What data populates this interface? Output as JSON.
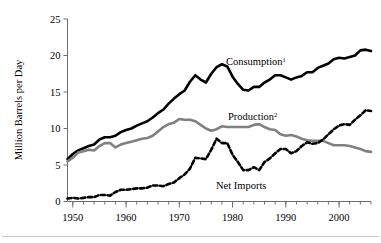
{
  "chart_data": {
    "type": "line",
    "title": "",
    "xlabel": "",
    "ylabel": "Million Barrels per Day",
    "xlim": [
      1949,
      2006
    ],
    "ylim": [
      0,
      25
    ],
    "grid": false,
    "legend_position": "inline-annotations",
    "y_ticks": [
      0,
      5,
      10,
      15,
      20,
      25
    ],
    "y_ticklabels": [
      "0",
      "5",
      "10",
      "15",
      "20",
      "25"
    ],
    "x_ticks": [
      1950,
      1960,
      1970,
      1980,
      1990,
      2000
    ],
    "x_ticklabels": [
      "1950",
      "1960",
      "1970",
      "1980",
      "1990",
      "2000"
    ],
    "x_minor_tick_interval": 2,
    "x": [
      1949,
      1950,
      1951,
      1952,
      1953,
      1954,
      1955,
      1956,
      1957,
      1958,
      1959,
      1960,
      1961,
      1962,
      1963,
      1964,
      1965,
      1966,
      1967,
      1968,
      1969,
      1970,
      1971,
      1972,
      1973,
      1974,
      1975,
      1976,
      1977,
      1978,
      1979,
      1980,
      1981,
      1982,
      1983,
      1984,
      1985,
      1986,
      1987,
      1988,
      1989,
      1990,
      1991,
      1992,
      1993,
      1994,
      1995,
      1996,
      1997,
      1998,
      1999,
      2000,
      2001,
      2002,
      2003,
      2004,
      2005,
      2006
    ],
    "series": [
      {
        "name": "Consumption",
        "label": "Consumption",
        "superscript": "1",
        "color": "#000000",
        "style": "solid",
        "width": 2.6,
        "values": [
          5.8,
          6.5,
          7.0,
          7.3,
          7.6,
          7.8,
          8.5,
          8.8,
          8.8,
          9.0,
          9.5,
          9.8,
          10.0,
          10.4,
          10.7,
          11.0,
          11.5,
          12.1,
          12.6,
          13.4,
          14.1,
          14.7,
          15.2,
          16.4,
          17.3,
          16.7,
          16.3,
          17.5,
          18.4,
          18.8,
          18.5,
          17.1,
          16.1,
          15.3,
          15.2,
          15.7,
          15.7,
          16.3,
          16.7,
          17.3,
          17.3,
          17.0,
          16.7,
          17.0,
          17.2,
          17.7,
          17.7,
          18.3,
          18.6,
          18.9,
          19.5,
          19.7,
          19.6,
          19.8,
          20.0,
          20.7,
          20.8,
          20.6
        ]
      },
      {
        "name": "Production",
        "label": "Production",
        "superscript": "2",
        "color": "#808080",
        "style": "solid",
        "width": 2.6,
        "values": [
          5.5,
          6.0,
          6.7,
          6.9,
          7.1,
          7.0,
          7.6,
          8.0,
          8.0,
          7.4,
          7.8,
          8.0,
          8.2,
          8.4,
          8.6,
          8.7,
          9.0,
          9.6,
          10.2,
          10.6,
          10.8,
          11.3,
          11.2,
          11.2,
          11.0,
          10.5,
          10.0,
          9.7,
          9.9,
          10.3,
          10.2,
          10.2,
          10.2,
          10.2,
          10.2,
          10.5,
          10.6,
          10.2,
          9.9,
          9.8,
          9.2,
          9.0,
          9.1,
          8.9,
          8.6,
          8.4,
          8.3,
          8.3,
          8.3,
          8.0,
          7.7,
          7.7,
          7.7,
          7.6,
          7.4,
          7.2,
          6.9,
          6.8
        ]
      },
      {
        "name": "Net Imports",
        "label": "Net Imports",
        "superscript": "",
        "color": "#000000",
        "style": "dashed",
        "width": 2.6,
        "values": [
          0.4,
          0.5,
          0.4,
          0.5,
          0.6,
          0.6,
          0.9,
          0.9,
          0.8,
          1.3,
          1.6,
          1.6,
          1.7,
          1.8,
          1.8,
          1.9,
          2.2,
          2.2,
          2.1,
          2.4,
          2.6,
          3.2,
          3.7,
          4.5,
          6.0,
          5.9,
          5.8,
          7.1,
          8.6,
          8.0,
          8.0,
          6.4,
          5.4,
          4.3,
          4.3,
          4.7,
          4.3,
          5.4,
          5.9,
          6.6,
          7.2,
          7.2,
          6.6,
          6.9,
          7.6,
          8.1,
          7.9,
          8.0,
          8.5,
          9.2,
          9.9,
          10.4,
          10.6,
          10.5,
          11.2,
          11.8,
          12.5,
          12.4
        ]
      }
    ]
  },
  "axis": {
    "y_title": "Million Barrels per Day"
  },
  "annotations": {
    "consumption": {
      "text": "Consumption",
      "sup": "1"
    },
    "production": {
      "text": "Production",
      "sup": "2"
    },
    "net_imports": {
      "text": "Net Imports",
      "sup": ""
    }
  }
}
